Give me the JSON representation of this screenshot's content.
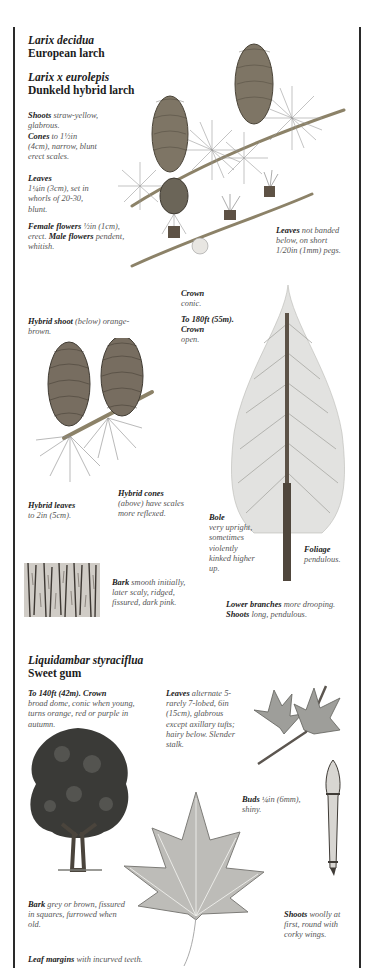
{
  "larch": {
    "species1_scientific": "Larix decidua",
    "species1_common": "European larch",
    "species2_scientific": "Larix x eurolepis",
    "species2_common": "Dunkeld hybrid larch",
    "notes": {
      "shoots_label": "Shoots",
      "shoots_text": " straw-yellow, glabrous.",
      "cones_label": "Cones",
      "cones_text": " to 1½in (4cm), narrow, blunt erect scales.",
      "leaves_label": "Leaves",
      "leaves_text": " 1¼in (3cm), set in whorls of 20-30, blunt.",
      "female_label": "Female flowers",
      "female_text": " ½in (1cm), erect. ",
      "male_label": "Male flowers",
      "male_text": " pendent, whitish.",
      "leaves_hybrid_label": "Leaves",
      "leaves_hybrid_text": " not banded below, on short 1/20in (1mm) pegs.",
      "crown_label": "Crown",
      "crown_text": "conic.",
      "height_label": "To 180ft (55m). Crown",
      "height_text": "open.",
      "hybrid_shoot_label": "Hybrid shoot",
      "hybrid_shoot_text": " (below) orange-brown.",
      "hybrid_leaves_label": "Hybrid leaves",
      "hybrid_leaves_text": "to 2in (5cm).",
      "hybrid_cones_label": "Hybrid cones",
      "hybrid_cones_text": "(above) have scales more reflexed.",
      "bole_label": "Bole",
      "bole_text": "very upright, sometimes violently kinked higher up.",
      "foliage_label": "Foliage",
      "foliage_text": "pendulous.",
      "bark_label": "Bark",
      "bark_text": " smooth initially, later scaly, ridged, fissured, dark pink.",
      "lower_branches_label": "Lower branches",
      "lower_branches_text": " more drooping.",
      "shoots2_label": "Shoots",
      "shoots2_text": " long, pendulous."
    }
  },
  "sweetgum": {
    "scientific": "Liquidambar styraciflua",
    "common": "Sweet gum",
    "notes": {
      "height_label": "To 140ft (42m). Crown",
      "height_text": "broad dome, conic when young, turns orange, red or purple in autumn.",
      "leaves_label": "Leaves",
      "leaves_text": " alternate 5-rarely 7-lobed, 6in (15cm), glabrous except axillary tufts; hairy below. Slender stalk.",
      "buds_label": "Buds",
      "buds_text": " ¼in (6mm), shiny.",
      "bark_label": "Bark",
      "bark_text": " grey or brown, fissured in squares, furrowed when old.",
      "shoots_label": "Shoots",
      "shoots_text": " woolly at first, round with corky wings.",
      "margins_label": "Leaf margins",
      "margins_text": " with incurved teeth."
    }
  },
  "colors": {
    "rule": "#2a2a2a",
    "text_dark": "#1b1b1b",
    "text_note": "#555555"
  }
}
